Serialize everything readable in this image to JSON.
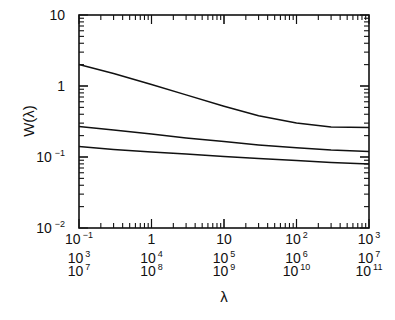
{
  "chart_data": {
    "type": "line",
    "title": "",
    "xlabel": "λ",
    "ylabel": "W(λ)",
    "xscale": "log",
    "yscale": "log",
    "xlim": [
      0.1,
      1000
    ],
    "ylim": [
      0.01,
      10
    ],
    "grid": false,
    "legend": "none",
    "x_tick_rows": [
      [
        "10⁻¹",
        "1",
        "10",
        "10²",
        "10³"
      ],
      [
        "10³",
        "10⁴",
        "10⁵",
        "10⁶",
        "10⁷"
      ],
      [
        "10⁷",
        "10⁸",
        "10⁹",
        "10¹⁰",
        "10¹¹"
      ]
    ],
    "y_ticks": [
      "10⁻²",
      "10⁻¹",
      "1",
      "10"
    ],
    "x": [
      0.1,
      0.3,
      1,
      3,
      10,
      30,
      100,
      300,
      1000
    ],
    "series": [
      {
        "name": "curve-1",
        "values": [
          2.0,
          1.5,
          1.05,
          0.75,
          0.52,
          0.38,
          0.3,
          0.265,
          0.26
        ]
      },
      {
        "name": "curve-2",
        "values": [
          0.27,
          0.24,
          0.21,
          0.185,
          0.165,
          0.148,
          0.135,
          0.125,
          0.12
        ]
      },
      {
        "name": "curve-3",
        "values": [
          0.14,
          0.128,
          0.118,
          0.11,
          0.102,
          0.095,
          0.089,
          0.084,
          0.08
        ]
      }
    ]
  },
  "labels": {
    "ylabel": "W(λ)",
    "xlabel": "λ",
    "y_ticks": [
      {
        "base": "10",
        "exp": "",
        "val": 10
      },
      {
        "base": "1",
        "exp": "",
        "val": 1
      },
      {
        "base": "10",
        "exp": "−1",
        "val": 0.1
      },
      {
        "base": "10",
        "exp": "−2",
        "val": 0.01
      }
    ]
  }
}
